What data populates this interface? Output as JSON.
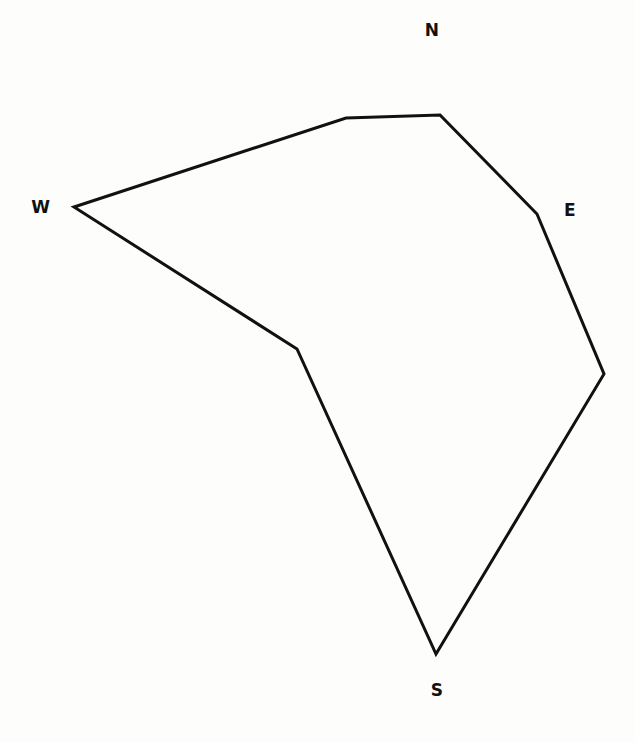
{
  "figure": {
    "background_color": "#fdfdfc",
    "stroke_color": "#111111",
    "stroke_width": 3,
    "fill": "none",
    "width": 635,
    "height": 742
  },
  "labels": {
    "north": "N",
    "east": "E",
    "south": "S",
    "west": "W"
  },
  "chart_data": {
    "type": "line",
    "xlabel": "",
    "ylabel": "",
    "xlim": [
      0,
      635
    ],
    "ylim": [
      742,
      0
    ],
    "grid": false,
    "legend": "none",
    "closed": true,
    "series": [
      {
        "name": "polygon-outline",
        "color": "#111111",
        "points": [
          [
            74,
            207
          ],
          [
            346,
            118
          ],
          [
            440,
            115
          ],
          [
            537,
            214
          ],
          [
            604,
            374
          ],
          [
            436,
            654
          ],
          [
            297,
            349
          ]
        ],
        "point_names": [
          "west-vertex",
          "north-west-shoulder",
          "north-east-shoulder",
          "east-upper-bend",
          "east-vertex",
          "south-vertex",
          "south-west-bend"
        ]
      }
    ],
    "annotations": [
      {
        "text": "N",
        "x": 432,
        "y": 30,
        "role": "compass-north"
      },
      {
        "text": "E",
        "x": 570,
        "y": 210,
        "role": "compass-east"
      },
      {
        "text": "S",
        "x": 437,
        "y": 690,
        "role": "compass-south"
      },
      {
        "text": "W",
        "x": 41,
        "y": 207,
        "role": "compass-west"
      }
    ]
  }
}
